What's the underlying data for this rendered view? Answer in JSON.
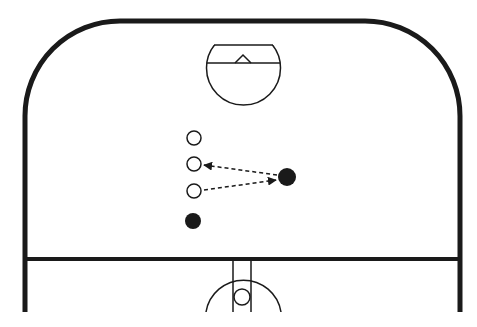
{
  "diagram": {
    "type": "hockey-rink-drill",
    "colors": {
      "background": "#ffffff",
      "lines": "#1a1a1a",
      "player_filled": "#1a1a1a",
      "player_open": "#ffffff"
    },
    "rink": {
      "left": 25,
      "right": 460,
      "top": 21,
      "bottom": 312,
      "corner_radius": 95,
      "blue_line_y": 259
    },
    "goal_crease": {
      "cx": 243.5,
      "cy": 68,
      "r": 37,
      "clip_top_y": 45,
      "goal_line_y": 63,
      "net": {
        "peak": [
          243,
          55
        ],
        "base_left": 235,
        "base_right": 251
      }
    },
    "center_faceoff": {
      "cx": 243.5,
      "cy": 300,
      "r": 38,
      "lane_x": [
        233,
        251
      ],
      "dot": {
        "cx": 242,
        "cy": 297,
        "r": 8
      }
    },
    "players": [
      {
        "id": "o1",
        "type": "open",
        "cx": 194,
        "cy": 138,
        "r": 7
      },
      {
        "id": "o2",
        "type": "open",
        "cx": 194,
        "cy": 164,
        "r": 7
      },
      {
        "id": "o3",
        "type": "open",
        "cx": 194,
        "cy": 191,
        "r": 7
      },
      {
        "id": "x1",
        "type": "filled",
        "cx": 193,
        "cy": 221,
        "r": 8
      },
      {
        "id": "x2",
        "type": "filled",
        "cx": 287,
        "cy": 177,
        "r": 9
      }
    ],
    "passes": [
      {
        "from": [
          277,
          175
        ],
        "to": [
          204,
          165
        ],
        "style": "dashed"
      },
      {
        "from": [
          204,
          190
        ],
        "to": [
          276,
          180
        ],
        "style": "dashed"
      }
    ]
  }
}
